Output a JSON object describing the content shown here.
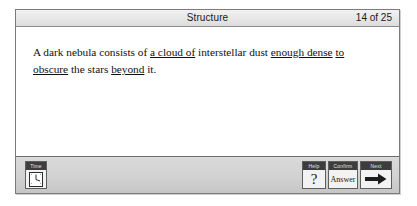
{
  "window": {
    "header": {
      "title": "Structure",
      "progress": "14 of 25"
    }
  },
  "content": {
    "question": {
      "segments": [
        {
          "text": "A dark nebula consists of ",
          "blank": false
        },
        {
          "text": "a cloud of",
          "blank": true
        },
        {
          "text": " interstellar dust ",
          "blank": false
        },
        {
          "text": "enough dense",
          "blank": true
        },
        {
          "text": " ",
          "blank": false
        },
        {
          "text": "to obscure",
          "blank": true
        },
        {
          "text": " the stars ",
          "blank": false
        },
        {
          "text": "beyond",
          "blank": true
        },
        {
          "text": " it.",
          "blank": false
        }
      ],
      "plain": "A dark nebula consists of a cloud of interstellar dust enough dense to obscure the stars beyond it."
    }
  },
  "toolbar": {
    "time": {
      "caption": "Time",
      "icon": "clock-icon"
    },
    "help": {
      "caption": "Help",
      "glyph": "?",
      "icon": "question-mark-icon"
    },
    "confirm": {
      "caption": "Confirm",
      "label": "Answer"
    },
    "next": {
      "caption": "Next",
      "icon": "arrow-right-icon"
    }
  },
  "colors": {
    "window_border": "#7b7b7b",
    "header_bg": "#e6e6e6",
    "toolbar_bg": "#d2d2d2",
    "caption_bg": "#3d3d3d",
    "text": "#111111"
  }
}
